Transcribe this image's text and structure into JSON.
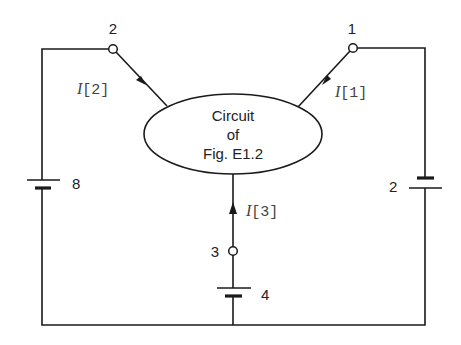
{
  "diagram": {
    "type": "circuit",
    "central_block": {
      "lines": [
        "Circuit",
        "of",
        "Fig. E1.2"
      ]
    },
    "nodes": [
      {
        "id": "1",
        "label": "1"
      },
      {
        "id": "2",
        "label": "2"
      },
      {
        "id": "3",
        "label": "3"
      }
    ],
    "currents": [
      {
        "id": "I1",
        "prefix": "I",
        "suffix": "[1]",
        "direction": "into block"
      },
      {
        "id": "I2",
        "prefix": "I",
        "suffix": "[2]",
        "direction": "into block"
      },
      {
        "id": "I3",
        "prefix": "I",
        "suffix": "[3]",
        "direction": "into block"
      }
    ],
    "sources": [
      {
        "id": "V8",
        "label": "8",
        "branch": "node 2"
      },
      {
        "id": "V2",
        "label": "2",
        "branch": "node 1"
      },
      {
        "id": "V4",
        "label": "4",
        "branch": "node 3"
      }
    ]
  }
}
